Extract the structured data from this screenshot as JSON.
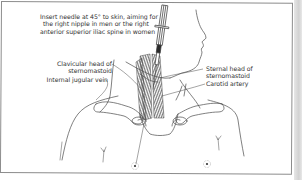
{
  "figure": {
    "type": "medical-illustration",
    "colors": {
      "line": "#4a4a4a",
      "text": "#333333",
      "frame": "#8c8c8c",
      "hatch": "#555555",
      "background": "#ffffff"
    }
  },
  "labels": {
    "instruction": {
      "lines": [
        "Insert needle at 45° to skin, aiming for",
        "the right nipple in men or the right",
        "anterior superior iliac spine in women"
      ]
    },
    "clavicular_head": {
      "lines": [
        "Clavicular head of",
        "sternomastoid"
      ]
    },
    "internal_jugular": {
      "lines": [
        "Internal jugular vein"
      ]
    },
    "sternal_head": {
      "lines": [
        "Sternal head of",
        "sternomastoid"
      ]
    },
    "carotid_artery": {
      "lines": [
        "Carotid artery"
      ]
    }
  }
}
